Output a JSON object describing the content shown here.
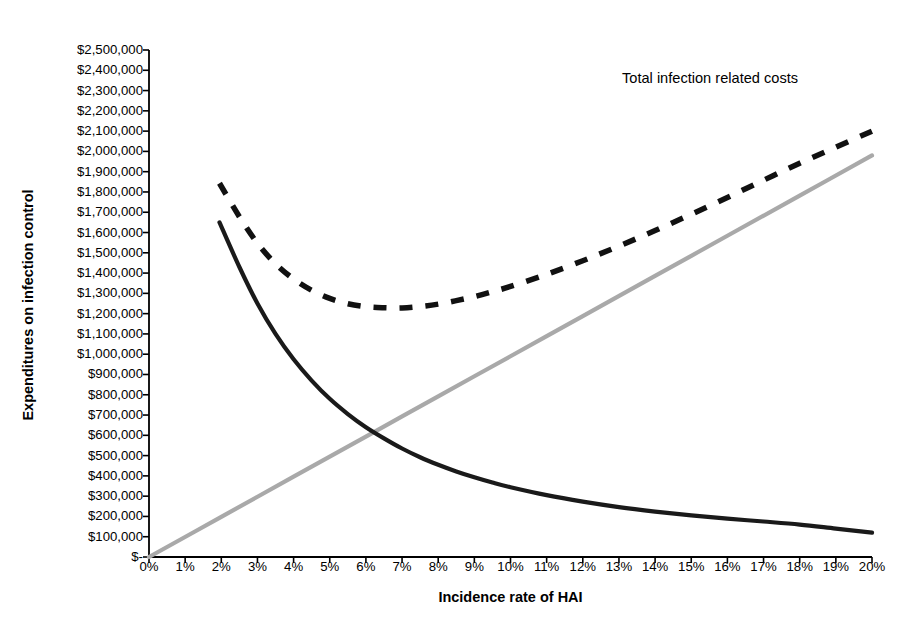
{
  "chart_data": {
    "type": "line",
    "title": "",
    "xlabel": "Incidence rate of HAI",
    "ylabel": "Expenditures on infection control",
    "annotations": [
      {
        "text": "Total infection related costs",
        "x": 16.0,
        "y": 2250000
      }
    ],
    "xlim": [
      0,
      20
    ],
    "ylim": [
      0,
      2500000
    ],
    "grid": false,
    "legend": "none",
    "xtick_labels": [
      "0%",
      "1%",
      "2%",
      "3%",
      "4%",
      "5%",
      "6%",
      "7%",
      "8%",
      "9%",
      "10%",
      "11%",
      "12%",
      "13%",
      "14%",
      "15%",
      "16%",
      "17%",
      "18%",
      "19%",
      "20%"
    ],
    "xtick_values": [
      0,
      1,
      2,
      3,
      4,
      5,
      6,
      7,
      8,
      9,
      10,
      11,
      12,
      13,
      14,
      15,
      16,
      17,
      18,
      19,
      20
    ],
    "ytick_labels": [
      "$2,500,000",
      "$2,400,000",
      "$2,300,000",
      "$2,200,000",
      "$2,100,000",
      "$2,000,000",
      "$1,900,000",
      "$1,800,000",
      "$1,700,000",
      "$1,600,000",
      "$1,500,000",
      "$1,400,000",
      "$1,300,000",
      "$1,200,000",
      "$1,100,000",
      "$1,000,000",
      "$900,000",
      "$800,000",
      "$700,000",
      "$600,000",
      "$500,000",
      "$400,000",
      "$300,000",
      "$200,000",
      "$100,000",
      "$-"
    ],
    "ytick_values": [
      2500000,
      2400000,
      2300000,
      2200000,
      2100000,
      2000000,
      1900000,
      1800000,
      1700000,
      1600000,
      1500000,
      1400000,
      1300000,
      1200000,
      1100000,
      1000000,
      900000,
      800000,
      700000,
      600000,
      500000,
      400000,
      300000,
      200000,
      100000,
      0
    ],
    "series": [
      {
        "name": "infection-control-expenditure",
        "style": "solid",
        "color": "#1a1a1a",
        "width": 4.2,
        "x": [
          1.95,
          2.5,
          3.0,
          3.5,
          4.0,
          4.5,
          5.0,
          5.5,
          6.0,
          6.5,
          7.0,
          7.5,
          8.0,
          8.5,
          9.0,
          9.5,
          10.0,
          11.0,
          12.0,
          13.0,
          14.0,
          15.0,
          16.0,
          17.0,
          18.0,
          19.0,
          20.0
        ],
        "y": [
          1650000,
          1430000,
          1250000,
          1100000,
          975000,
          870000,
          780000,
          705000,
          640000,
          585000,
          535000,
          492000,
          455000,
          422000,
          393000,
          367000,
          344000,
          305000,
          273000,
          246000,
          224000,
          205000,
          189000,
          175000,
          160000,
          140000,
          120000
        ]
      },
      {
        "name": "infection-related-cost",
        "style": "solid",
        "color": "#a9a9a9",
        "width": 4.2,
        "x": [
          0,
          2,
          4,
          6,
          8,
          10,
          12,
          14,
          16,
          18,
          20
        ],
        "y": [
          0,
          198000,
          396000,
          594000,
          792000,
          990000,
          1188000,
          1386000,
          1584000,
          1782000,
          1980000
        ]
      },
      {
        "name": "total-infection-related-costs",
        "style": "dashed",
        "color": "#111111",
        "width": 5.5,
        "x": [
          1.95,
          2.5,
          3.0,
          3.5,
          4.0,
          4.5,
          5.0,
          5.5,
          6.0,
          6.5,
          7.0,
          7.5,
          8.0,
          8.5,
          9.0,
          9.5,
          10.0,
          11.0,
          12.0,
          13.0,
          14.0,
          15.0,
          16.0,
          17.0,
          18.0,
          19.0,
          20.0
        ],
        "y": [
          1843000,
          1678000,
          1547000,
          1446000,
          1371000,
          1315000,
          1275000,
          1249000,
          1234000,
          1229000,
          1228000,
          1235000,
          1247000,
          1264000,
          1284000,
          1308000,
          1334000,
          1394000,
          1461000,
          1533000,
          1610000,
          1690000,
          1773000,
          1858000,
          1942000,
          2021000,
          2100000
        ]
      }
    ]
  }
}
